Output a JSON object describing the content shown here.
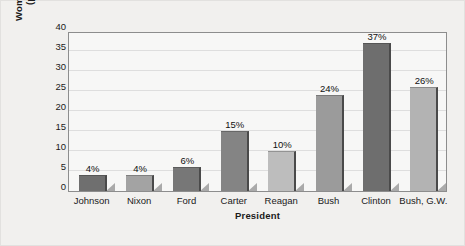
{
  "chart_data": {
    "type": "bar",
    "title": "",
    "xlabel": "President",
    "ylabel_line1": "Women Appointees",
    "ylabel_line2": "(percentage)",
    "categories": [
      "Johnson",
      "Nixon",
      "Ford",
      "Carter",
      "Reagan",
      "Bush",
      "Clinton",
      "Bush, G.W."
    ],
    "values": [
      4,
      4,
      6,
      15,
      10,
      24,
      37,
      26
    ],
    "value_labels": [
      "4%",
      "4%",
      "6%",
      "15%",
      "10%",
      "24%",
      "37%",
      "26%"
    ],
    "bar_colors": [
      "#6f6f6f",
      "#a3a3a3",
      "#777777",
      "#848484",
      "#bdbdbd",
      "#9b9b9b",
      "#6e6e6e",
      "#b3b3b3"
    ],
    "ylim": [
      0,
      40
    ],
    "yticks": [
      0,
      5,
      10,
      15,
      20,
      25,
      30,
      35,
      40
    ],
    "ytick_labels": [
      "0",
      "5",
      "10",
      "15",
      "20",
      "25",
      "30",
      "35",
      "40"
    ],
    "grid": true,
    "legend": "none",
    "figure_background": "#f1f0ee",
    "plot_background": "#f7f7f6",
    "axis_color": "#8d8d8d",
    "gridline_color": "#dedede"
  }
}
